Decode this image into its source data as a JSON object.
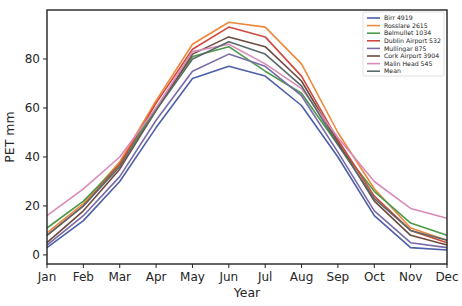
{
  "chart_data": {
    "type": "line",
    "title": "",
    "xlabel": "Year",
    "ylabel": "PET mm",
    "categories": [
      "Jan",
      "Feb",
      "Mar",
      "Apr",
      "May",
      "Jun",
      "Jul",
      "Aug",
      "Sep",
      "Oct",
      "Nov",
      "Dec"
    ],
    "yticks": [
      0,
      20,
      40,
      60,
      80
    ],
    "ylim": [
      -3.7,
      100
    ],
    "grid": false,
    "legend_position": "upper right",
    "series": [
      {
        "name": "Birr 4919",
        "color": "#4c5fa8",
        "values": [
          3,
          14,
          30,
          52,
          72,
          77,
          73,
          61,
          40,
          16,
          3,
          2
        ]
      },
      {
        "name": "Rosslare 2615",
        "color": "#f0883a",
        "values": [
          9,
          21,
          38,
          63,
          86,
          95,
          93,
          78,
          50,
          27,
          11,
          6
        ]
      },
      {
        "name": "Belmullet 1034",
        "color": "#4a9a4a",
        "values": [
          11,
          22,
          37,
          60,
          81,
          85,
          75,
          66,
          45,
          26,
          13,
          8
        ]
      },
      {
        "name": "Dublin Airport 532",
        "color": "#d1483c",
        "values": [
          8,
          20,
          37,
          62,
          84,
          93,
          89,
          73,
          47,
          24,
          10,
          5
        ]
      },
      {
        "name": "Mullingar 875",
        "color": "#7a6aa8",
        "values": [
          4,
          16,
          32,
          55,
          75,
          82,
          77,
          65,
          42,
          18,
          5,
          3
        ]
      },
      {
        "name": "Cork Airport 3904",
        "color": "#6e4a3e",
        "values": [
          5,
          18,
          35,
          59,
          82,
          89,
          85,
          71,
          46,
          22,
          8,
          4
        ]
      },
      {
        "name": "Malin Head 545",
        "color": "#d98bb8",
        "values": [
          16,
          27,
          40,
          60,
          83,
          86,
          78,
          68,
          48,
          30,
          19,
          15
        ]
      },
      {
        "name": "Mean",
        "color": "#5a6a6a",
        "values": [
          8,
          20,
          36,
          59,
          80,
          87,
          82,
          69,
          45,
          23,
          10,
          6
        ]
      }
    ]
  }
}
